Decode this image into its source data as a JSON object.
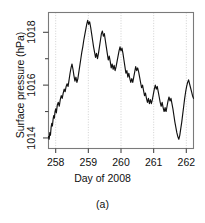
{
  "chart_data": {
    "type": "line",
    "title": "",
    "caption": "(a)",
    "xlabel": "Day of 2008",
    "ylabel": "Surface pressure (hPa)",
    "xlim": [
      257.78,
      262.22
    ],
    "ylim": [
      1013.6,
      1018.75
    ],
    "xticks": [
      258,
      259,
      260,
      261,
      262
    ],
    "xticklabels": [
      "258",
      "259",
      "260",
      "261",
      "262"
    ],
    "yticks": [
      1014,
      1016,
      1018
    ],
    "yticklabels": [
      "1014",
      "1016",
      "1018"
    ],
    "yminorticks": [
      1015,
      1017
    ],
    "grid": "vertical-dotted-at-xticks",
    "legend": "none",
    "line_color": "#111111",
    "series": [
      {
        "name": "Surface pressure",
        "x": [
          257.78,
          257.8,
          257.82,
          257.84,
          257.86,
          257.88,
          257.9,
          257.92,
          257.94,
          257.96,
          257.98,
          258.0,
          258.02,
          258.05,
          258.08,
          258.11,
          258.14,
          258.17,
          258.2,
          258.23,
          258.26,
          258.29,
          258.32,
          258.35,
          258.38,
          258.41,
          258.44,
          258.47,
          258.5,
          258.53,
          258.56,
          258.59,
          258.62,
          258.65,
          258.68,
          258.71,
          258.74,
          258.77,
          258.8,
          258.83,
          258.86,
          258.89,
          258.92,
          258.95,
          258.98,
          259.01,
          259.04,
          259.07,
          259.1,
          259.13,
          259.16,
          259.19,
          259.22,
          259.25,
          259.28,
          259.31,
          259.34,
          259.37,
          259.4,
          259.43,
          259.46,
          259.49,
          259.52,
          259.55,
          259.58,
          259.61,
          259.64,
          259.67,
          259.7,
          259.73,
          259.76,
          259.79,
          259.82,
          259.85,
          259.88,
          259.91,
          259.94,
          259.97,
          260.0,
          260.03,
          260.06,
          260.09,
          260.12,
          260.15,
          260.18,
          260.21,
          260.24,
          260.27,
          260.3,
          260.33,
          260.36,
          260.39,
          260.42,
          260.45,
          260.48,
          260.51,
          260.54,
          260.57,
          260.6,
          260.63,
          260.66,
          260.69,
          260.72,
          260.75,
          260.78,
          260.81,
          260.84,
          260.87,
          260.9,
          260.93,
          260.96,
          260.99,
          261.02,
          261.05,
          261.08,
          261.11,
          261.14,
          261.17,
          261.2,
          261.23,
          261.26,
          261.29,
          261.32,
          261.35,
          261.38,
          261.41,
          261.44,
          261.47,
          261.5,
          261.53,
          261.56,
          261.59,
          261.62,
          261.65,
          261.68,
          261.71,
          261.74,
          261.77,
          261.8,
          261.83,
          261.86,
          261.89,
          261.92,
          261.95,
          261.98,
          262.01,
          262.04,
          262.07,
          262.1,
          262.13,
          262.16,
          262.19,
          262.22
        ],
        "y": [
          1014.05,
          1013.95,
          1014.2,
          1014.1,
          1014.4,
          1014.55,
          1014.45,
          1014.7,
          1014.85,
          1014.75,
          1015.0,
          1015.1,
          1014.95,
          1015.25,
          1015.35,
          1015.2,
          1015.45,
          1015.6,
          1015.5,
          1015.7,
          1015.85,
          1015.75,
          1015.95,
          1016.05,
          1015.95,
          1016.2,
          1016.45,
          1016.65,
          1016.8,
          1016.6,
          1016.35,
          1016.15,
          1016.3,
          1016.1,
          1016.25,
          1016.5,
          1016.75,
          1017.0,
          1017.25,
          1017.45,
          1017.7,
          1017.9,
          1018.1,
          1018.3,
          1018.45,
          1018.3,
          1018.4,
          1018.2,
          1017.95,
          1017.7,
          1017.45,
          1017.25,
          1017.05,
          1017.2,
          1017.0,
          1017.2,
          1017.45,
          1017.7,
          1017.95,
          1018.05,
          1017.85,
          1017.95,
          1017.7,
          1017.45,
          1017.2,
          1016.95,
          1017.1,
          1016.9,
          1016.65,
          1016.8,
          1016.6,
          1016.75,
          1016.55,
          1016.7,
          1016.9,
          1017.1,
          1017.3,
          1017.45,
          1017.3,
          1017.4,
          1017.2,
          1016.95,
          1016.7,
          1016.45,
          1016.55,
          1016.3,
          1016.45,
          1016.25,
          1016.1,
          1016.25,
          1016.1,
          1016.3,
          1016.5,
          1016.7,
          1016.55,
          1016.65,
          1016.5,
          1016.3,
          1016.1,
          1015.9,
          1016.0,
          1015.8,
          1015.6,
          1015.7,
          1015.5,
          1015.35,
          1015.5,
          1015.3,
          1015.45,
          1015.3,
          1015.45,
          1015.65,
          1015.85,
          1016.0,
          1015.85,
          1015.95,
          1015.75,
          1015.55,
          1015.35,
          1015.2,
          1015.35,
          1015.15,
          1015.0,
          1015.15,
          1015.0,
          1015.2,
          1015.4,
          1015.55,
          1015.4,
          1015.5,
          1015.3,
          1015.1,
          1014.85,
          1014.6,
          1014.4,
          1014.2,
          1014.05,
          1013.95,
          1014.1,
          1014.35,
          1014.6,
          1014.9,
          1015.2,
          1015.5,
          1015.75,
          1015.95,
          1016.1,
          1016.2,
          1016.05,
          1015.9,
          1015.75,
          1015.6,
          1015.5
        ]
      }
    ]
  }
}
